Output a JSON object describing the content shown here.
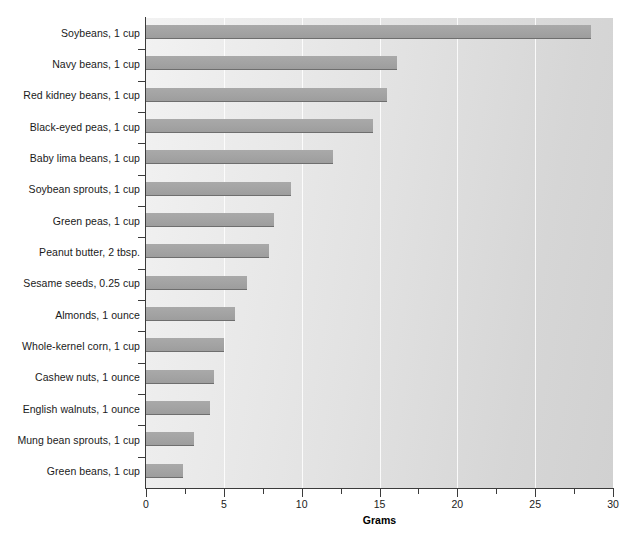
{
  "chart_data": {
    "type": "bar",
    "orientation": "horizontal",
    "title": "",
    "xlabel": "Grams",
    "ylabel": "",
    "xlim": [
      0,
      30
    ],
    "xticks": [
      0,
      5,
      10,
      15,
      20,
      25,
      30
    ],
    "xtick_labels": [
      "0",
      "5",
      "10",
      "15",
      "20",
      "25",
      "30"
    ],
    "minor_tick_step": 2.5,
    "grid": "vertical white gridlines at major ticks",
    "legend": "none",
    "categories": [
      "Soybeans, 1 cup",
      "Navy beans, 1 cup",
      "Red kidney beans, 1 cup",
      "Black-eyed peas, 1 cup",
      "Baby lima beans, 1 cup",
      "Soybean sprouts, 1 cup",
      "Green peas, 1 cup",
      "Peanut butter, 2 tbsp.",
      "Sesame seeds, 0.25 cup",
      "Almonds, 1 ounce",
      "Whole-kernel corn, 1 cup",
      "Cashew nuts, 1 ounce",
      "English walnuts, 1 ounce",
      "Mung bean sprouts, 1 cup",
      "Green beans, 1 cup"
    ],
    "values": [
      28.6,
      16.1,
      15.5,
      14.6,
      12.0,
      9.3,
      8.2,
      7.9,
      6.5,
      5.7,
      5.0,
      4.4,
      4.1,
      3.1,
      2.4
    ],
    "unit": "grams",
    "bar_color": "#a3a3a3",
    "bar_edge_color": "#6e6e6e",
    "plot_background": "gradient light gray to medium gray",
    "axis_color": "#3b3b3b"
  }
}
